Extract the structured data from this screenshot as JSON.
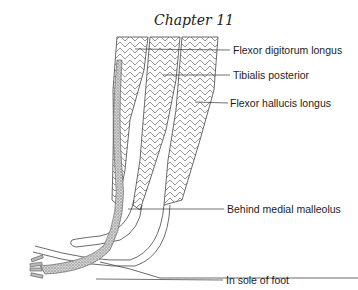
{
  "header": {
    "chapter": "Chapter 11"
  },
  "figure": {
    "labels": [
      {
        "id": "fdl",
        "text": "Flexor digitorum longus",
        "x": 233,
        "y": 44
      },
      {
        "id": "tp",
        "text": "Tibialis posterior",
        "x": 233,
        "y": 69
      },
      {
        "id": "fhl",
        "text": "Flexor hallucis longus",
        "x": 230,
        "y": 97
      },
      {
        "id": "bmm",
        "text": "Behind medial malleolus",
        "x": 227,
        "y": 203
      },
      {
        "id": "sole",
        "text": "In sole of foot",
        "x": 226,
        "y": 274
      }
    ],
    "colors": {
      "ink": "#333333",
      "stipple": "#9a9a9a",
      "background": "#ffffff"
    }
  }
}
